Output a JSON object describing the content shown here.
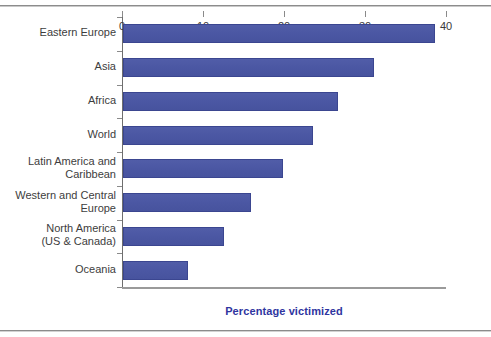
{
  "chart_data": {
    "type": "bar",
    "orientation": "horizontal",
    "title": "",
    "subtitle": "",
    "xlabel": "Percentage victimized",
    "ylabel": "",
    "xlim": [
      0,
      40
    ],
    "xticks": [
      0,
      10,
      20,
      30,
      40
    ],
    "xticklabels": [
      "0",
      "10",
      "20",
      "30",
      "40"
    ],
    "grid": false,
    "legend": null,
    "bar_color": "#4b57a3",
    "axis_title_color": "#2f35a0",
    "categories": [
      "Eastern Europe",
      "Asia",
      "Africa",
      "World",
      "Latin America and\nCaribbean",
      "Western and Central\nEurope",
      "North America\n(US & Canada)",
      "Oceania"
    ],
    "values": [
      38.5,
      31.0,
      26.5,
      23.5,
      19.7,
      15.8,
      12.5,
      8.0
    ]
  },
  "figure": {
    "top_rule": "horizontal-rule",
    "bottom_rule": "horizontal-rule"
  }
}
